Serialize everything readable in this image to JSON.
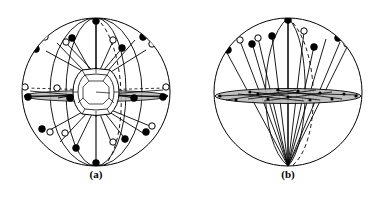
{
  "figure": {
    "type": "scientific-line-diagram",
    "background_color": "#ffffff",
    "stroke_color": "#000000",
    "fill_node_color": "#000000",
    "open_node_color": "#ffffff",
    "band_fill_color": "#b8b8b8",
    "dashed_color": "#000000",
    "width": 384,
    "height": 205
  },
  "panels": [
    {
      "id": "a",
      "caption": "(a)",
      "description": "Polyhedral cage core viewed along the principal axis with radiating arms terminating in alternating filled and open spheres",
      "circle": {
        "cx": 96,
        "cy": 92,
        "r": 74
      },
      "core": {
        "shape": "rounded-octagon",
        "cx": 96,
        "cy": 92,
        "rx": 23,
        "ry": 22
      },
      "meridians": [
        {
          "name": "meridian-vertical",
          "style": "solid"
        },
        {
          "name": "meridian-left",
          "style": "solid"
        },
        {
          "name": "meridian-right",
          "style": "solid"
        },
        {
          "name": "meridian-dashed",
          "style": "dashed"
        }
      ],
      "equator_band": {
        "style": "flattened-ellipse",
        "rx": 72,
        "ry": 6
      },
      "arms": [
        {
          "index": 1,
          "tip": "filled"
        },
        {
          "index": 2,
          "tip": "open"
        },
        {
          "index": 3,
          "tip": "filled"
        },
        {
          "index": 4,
          "tip": "open"
        },
        {
          "index": 5,
          "tip": "filled"
        },
        {
          "index": 6,
          "tip": "open"
        },
        {
          "index": 7,
          "tip": "filled"
        },
        {
          "index": 8,
          "tip": "open"
        },
        {
          "index": 9,
          "tip": "filled"
        },
        {
          "index": 10,
          "tip": "open"
        },
        {
          "index": 11,
          "tip": "filled"
        },
        {
          "index": 12,
          "tip": "open"
        },
        {
          "index": 13,
          "tip": "filled"
        },
        {
          "index": 14,
          "tip": "open"
        },
        {
          "index": 15,
          "tip": "filled"
        },
        {
          "index": 16,
          "tip": "open"
        }
      ],
      "node_counts": {
        "filled": 16,
        "open": 14
      }
    },
    {
      "id": "b",
      "caption": "(b)",
      "description": "Same structure viewed perpendicular to the principal axis; arms converge at the lower pole and the equatorial shell projects as a flat shaded ellipse",
      "circle": {
        "cx": 288,
        "cy": 92,
        "r": 74
      },
      "pole": {
        "x": 288,
        "y": 166
      },
      "equator_band": {
        "cx": 288,
        "cy": 96,
        "rx": 73,
        "ry": 8
      },
      "meridians": [
        {
          "name": "meridian-vertical",
          "style": "solid"
        },
        {
          "name": "meridian-left",
          "style": "solid"
        },
        {
          "name": "meridian-right",
          "style": "solid"
        },
        {
          "name": "meridian-dashed",
          "style": "dashed"
        }
      ],
      "arms": [
        {
          "index": 1,
          "tip": "filled"
        },
        {
          "index": 2,
          "tip": "open"
        },
        {
          "index": 3,
          "tip": "filled"
        },
        {
          "index": 4,
          "tip": "open"
        },
        {
          "index": 5,
          "tip": "filled"
        },
        {
          "index": 6,
          "tip": "open"
        },
        {
          "index": 7,
          "tip": "filled"
        },
        {
          "index": 8,
          "tip": "open"
        },
        {
          "index": 9,
          "tip": "filled"
        },
        {
          "index": 10,
          "tip": "open"
        },
        {
          "index": 11,
          "tip": "filled"
        }
      ],
      "node_counts": {
        "filled": 7,
        "open": 5
      }
    }
  ]
}
